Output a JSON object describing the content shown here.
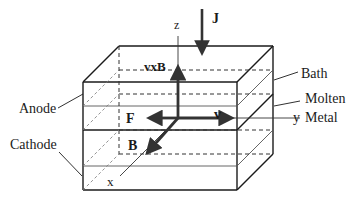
{
  "diagram": {
    "axes": {
      "z": "z",
      "y": "y",
      "x": "x"
    },
    "vectors": {
      "current_density": "J",
      "cross_product": "vxB",
      "force": "F",
      "velocity": "v",
      "magnetic_field": "B"
    },
    "labels": {
      "anode": "Anode",
      "cathode": "Cathode",
      "bath": "Bath",
      "molten": "Molten",
      "metal": "Metal"
    },
    "colors": {
      "line": "#1a1a1a",
      "vector": "#333333",
      "dashed": "#555555"
    }
  }
}
